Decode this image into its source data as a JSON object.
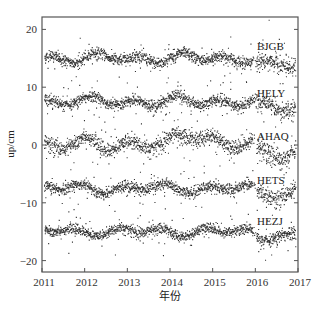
{
  "chart_data": {
    "type": "scatter",
    "title": "",
    "xlabel": "年份",
    "ylabel": "up/cm",
    "xlim": [
      2011,
      2017
    ],
    "ylim": [
      -22.5,
      22
    ],
    "x_ticks": [
      "2011",
      "2012",
      "2013",
      "2014",
      "2015",
      "2016",
      "2017"
    ],
    "y_ticks": [
      "20",
      "10",
      "0",
      "−10",
      "−20"
    ],
    "y_tick_values": [
      20,
      10,
      0,
      -10,
      -20
    ],
    "grid": false,
    "legend": "inline labels near right edge",
    "series": [
      {
        "name": "BJGB",
        "offset": 15.0,
        "annual_amplitude": 0.6,
        "noise": 0.9,
        "jump_2016": -1.2,
        "label_value": 17.2
      },
      {
        "name": "HELY",
        "offset": 7.5,
        "annual_amplitude": 0.6,
        "noise": 0.9,
        "jump_2016": -1.0,
        "label_value": 9.0
      },
      {
        "name": "AHAQ",
        "offset": 0.0,
        "annual_amplitude": 0.8,
        "noise": 1.2,
        "jump_2016": -1.5,
        "bulge_2014_2015": 1.8,
        "label_value": 1.6
      },
      {
        "name": "HETS",
        "offset": -7.5,
        "annual_amplitude": 0.6,
        "noise": 0.9,
        "jump_2016": -0.8,
        "label_value": -6.0
      },
      {
        "name": "HEZJ",
        "offset": -15.0,
        "annual_amplitude": 0.5,
        "noise": 0.8,
        "jump_2016": -0.8,
        "label_value": -13.2
      }
    ],
    "point_color": "#333333"
  }
}
